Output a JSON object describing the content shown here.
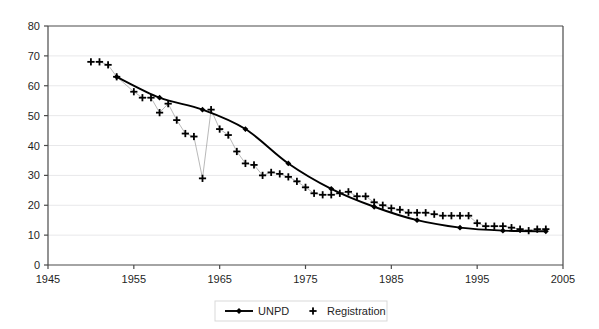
{
  "chart_data": {
    "type": "line",
    "title": "",
    "subtitle": "",
    "xlabel": "",
    "ylabel": "",
    "xlim": [
      1945,
      2005
    ],
    "ylim": [
      0,
      80
    ],
    "xticks": [
      1945,
      1955,
      1965,
      1975,
      1985,
      1995,
      2005
    ],
    "yticks": [
      0,
      10,
      20,
      30,
      40,
      50,
      60,
      70,
      80
    ],
    "xtick_labels": [
      "1945",
      "1955",
      "1965",
      "1975",
      "1985",
      "1995",
      "2005"
    ],
    "ytick_labels": [
      "0",
      "10",
      "20",
      "30",
      "40",
      "50",
      "60",
      "70",
      "80"
    ],
    "grid": "horizontal",
    "legend_position": "bottom-center",
    "series": [
      {
        "name": "UNPD",
        "marker": "diamond",
        "line": "solid",
        "color": "#000000",
        "x": [
          1953,
          1958,
          1963,
          1968,
          1973,
          1978,
          1983,
          1988,
          1993,
          1998,
          2003
        ],
        "values": [
          63,
          56,
          52,
          45.5,
          34,
          25.5,
          19.5,
          15,
          12.5,
          11.5,
          11.3
        ]
      },
      {
        "name": "Registration",
        "marker": "plus",
        "line": "thin-connector",
        "color": "#000000",
        "x": [
          1950,
          1951,
          1952,
          1953,
          1955,
          1956,
          1957,
          1958,
          1959,
          1960,
          1961,
          1962,
          1963,
          1964,
          1965,
          1966,
          1967,
          1968,
          1969,
          1970,
          1971,
          1972,
          1973,
          1974,
          1975,
          1976,
          1977,
          1978,
          1979,
          1980,
          1981,
          1982,
          1983,
          1984,
          1985,
          1986,
          1987,
          1988,
          1989,
          1990,
          1991,
          1992,
          1993,
          1994,
          1995,
          1996,
          1997,
          1998,
          1999,
          2000,
          2001,
          2002,
          2003
        ],
        "values": [
          68,
          68,
          67,
          63,
          58,
          56,
          56,
          51,
          54,
          48.5,
          44,
          43,
          29,
          52,
          45.5,
          43.5,
          38,
          34,
          33.5,
          30,
          31,
          30.5,
          29.5,
          28,
          26,
          24,
          23.5,
          23.5,
          24,
          24.5,
          23,
          23,
          21,
          20,
          19,
          18.5,
          17.5,
          17.5,
          17.5,
          17,
          16.5,
          16.5,
          16.5,
          16.5,
          14,
          13,
          13,
          13,
          12.5,
          12,
          11.5,
          12,
          12
        ]
      }
    ],
    "legend": [
      {
        "label": "UNPD",
        "marker": "line-diamond"
      },
      {
        "label": "Registration",
        "marker": "plus"
      }
    ],
    "colors": {
      "axis": "#4a4a4a",
      "grid": "#e8e8ea",
      "series": "#000000",
      "background": "#ffffff",
      "legend_border": "#d9d9d9"
    }
  }
}
